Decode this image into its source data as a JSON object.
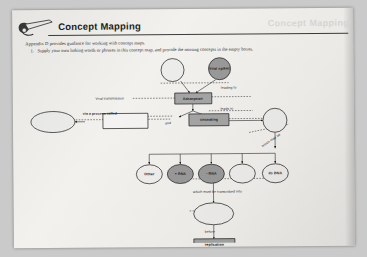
{
  "page": {
    "header": {
      "title": "Concept Mapping",
      "ghost_title": "Concept Mapping",
      "icon": "pencil-writing-icon"
    },
    "lead": "Appendix D provides guidance for working with concept maps.",
    "items": [
      {
        "number": "1.",
        "text": "Supply your own linking words or phrases in this concept map, and provide the missing concepts in the empty boxes."
      }
    ]
  },
  "concept_map": {
    "nodes": [
      {
        "id": "n1",
        "label": "",
        "shape": "circle",
        "filled": false
      },
      {
        "id": "n2",
        "label": "Viral spikes",
        "shape": "circle",
        "filled": true
      },
      {
        "id": "n3",
        "label": "Adsorption",
        "shape": "rect",
        "filled": true
      },
      {
        "id": "n4",
        "label": "",
        "shape": "ellipse",
        "filled": false
      },
      {
        "id": "n5",
        "label": "",
        "shape": "rect",
        "filled": false
      },
      {
        "id": "n6",
        "label": "uncoating",
        "shape": "rect",
        "filled": true
      },
      {
        "id": "n7",
        "label": "",
        "shape": "circle",
        "filled": false
      },
      {
        "id": "n8",
        "label": "Other",
        "shape": "ellipse",
        "filled": false
      },
      {
        "id": "n9",
        "label": "+ RNA",
        "shape": "ellipse",
        "filled": true
      },
      {
        "id": "n10",
        "label": "- RNA",
        "shape": "ellipse",
        "filled": true
      },
      {
        "id": "n11",
        "label": "",
        "shape": "ellipse",
        "filled": false
      },
      {
        "id": "n12",
        "label": "ds DNA",
        "shape": "ellipse",
        "filled": false
      },
      {
        "id": "n13",
        "label": "",
        "shape": "ellipse",
        "filled": false
      },
      {
        "id": "n14",
        "label": "replication",
        "shape": "rect",
        "filled": true
      }
    ],
    "link_labels": [
      {
        "id": "l1",
        "text": "leading to"
      },
      {
        "id": "l2",
        "text": "Viral transmission"
      },
      {
        "id": "l3",
        "text": "leads to"
      },
      {
        "id": "l4",
        "text": "via a process called"
      },
      {
        "id": "l5",
        "text": "and"
      },
      {
        "id": "l6",
        "text": "which may be"
      },
      {
        "id": "l7",
        "text": "which must be transcribed into"
      },
      {
        "id": "l8",
        "text": "before"
      }
    ]
  },
  "colors": {
    "page": "#f2f1ee",
    "mat": "#cacaca",
    "ink": "#1a1a1a",
    "node_fill_dark": "#9a9a9a",
    "node_fill_light": "#ececec"
  }
}
